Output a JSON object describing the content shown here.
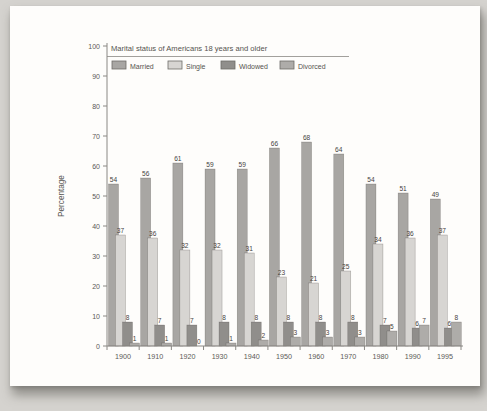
{
  "chart_data": {
    "type": "bar",
    "title": "Marital status of Americans 18 years and older",
    "ylabel": "Percentage",
    "ylim": [
      0,
      100
    ],
    "ytick_step": 10,
    "grid": false,
    "legend_position": "top",
    "categories": [
      "1900",
      "1910",
      "1920",
      "1930",
      "1940",
      "1950",
      "1960",
      "1970",
      "1980",
      "1990",
      "1995"
    ],
    "series": [
      {
        "name": "Married",
        "color": "#a8a6a3",
        "values": [
          54,
          56,
          61,
          59,
          59,
          66,
          68,
          64,
          54,
          51,
          49
        ]
      },
      {
        "name": "Single",
        "color": "#d7d5d2",
        "values": [
          37,
          36,
          32,
          32,
          31,
          23,
          21,
          25,
          34,
          36,
          37
        ]
      },
      {
        "name": "Widowed",
        "color": "#908e8b",
        "values": [
          8,
          7,
          7,
          8,
          8,
          8,
          8,
          8,
          7,
          6,
          6
        ]
      },
      {
        "name": "Divorced",
        "color": "#aeaca9",
        "values": [
          1,
          1,
          0,
          1,
          2,
          3,
          3,
          3,
          5,
          7,
          8
        ]
      }
    ]
  }
}
